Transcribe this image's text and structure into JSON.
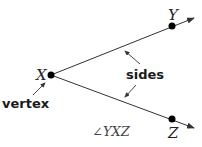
{
  "diagram": {
    "points": {
      "X": {
        "label": "X",
        "x": 51,
        "y": 75
      },
      "Y": {
        "label": "Y",
        "x": 172,
        "y": 26
      },
      "Z": {
        "label": "Z",
        "x": 172,
        "y": 119
      }
    },
    "labels": {
      "sides": "sides",
      "vertex": "vertex",
      "angle": "∠YXZ"
    },
    "colors": {
      "line": "#333333",
      "point": "#000000",
      "text": "#1a1a1a"
    }
  }
}
